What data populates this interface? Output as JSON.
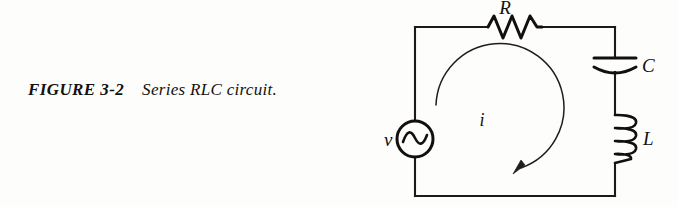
{
  "caption": {
    "figure_label": "FIGURE 3-2",
    "title": "Series RLC circuit."
  },
  "circuit": {
    "name": "series-rlc-circuit",
    "labels": {
      "resistor": "R",
      "capacitor": "C",
      "inductor": "L",
      "source": "v",
      "current": "i"
    },
    "components": [
      {
        "id": "resistor",
        "symbol": "R",
        "type": "resistor",
        "position": "top-rail"
      },
      {
        "id": "capacitor",
        "symbol": "C",
        "type": "capacitor",
        "position": "right-rail-upper"
      },
      {
        "id": "inductor",
        "symbol": "L",
        "type": "inductor",
        "position": "right-rail-lower"
      },
      {
        "id": "source",
        "symbol": "v",
        "type": "ac-voltage-source",
        "position": "left-rail"
      }
    ],
    "current_arrow": {
      "symbol": "i",
      "direction": "clockwise"
    },
    "colors": {
      "ink": "#14110f",
      "wire": "#1d1a18",
      "page": "#fdfdfb"
    }
  }
}
